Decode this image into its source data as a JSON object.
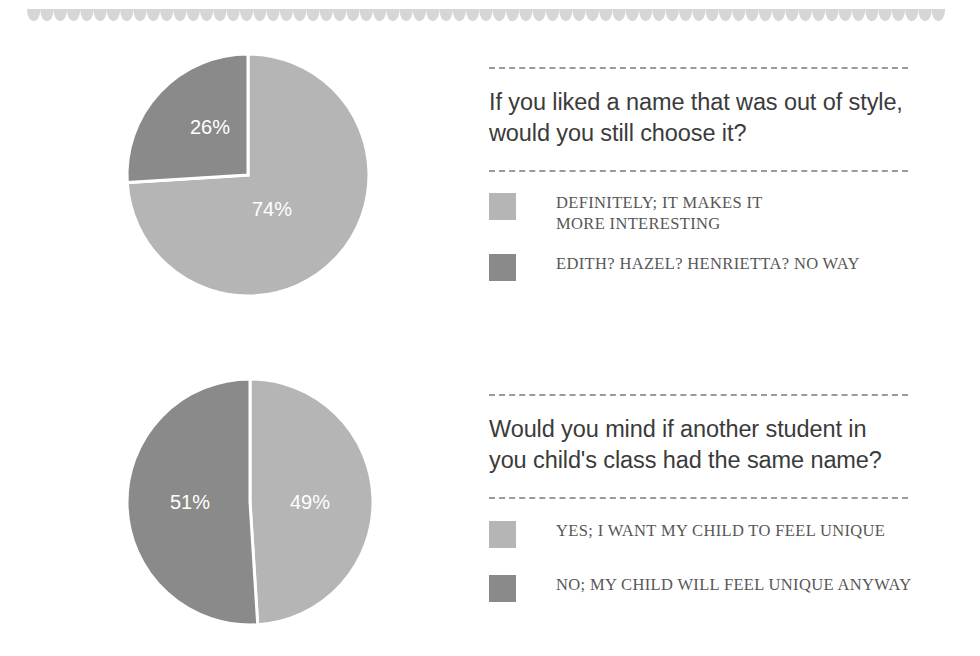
{
  "decor": {
    "scallop_color": "#d6d6d6",
    "scallop_count": 69
  },
  "palette": {
    "light_gray": "#b5b5b5",
    "dark_gray": "#8a8a8a",
    "question_text": "#3b3b3b",
    "legend_text": "#575757",
    "rule_color": "#9a9a9a",
    "slice_divider": "#ffffff"
  },
  "sections": [
    {
      "question": "If you liked a name that was out of style,\nwould you still choose it?",
      "legend": [
        {
          "label": "DEFINITELY; IT MAKES IT\nMORE INTERESTING",
          "color": "#b5b5b5"
        },
        {
          "label": "EDITH? HAZEL? HENRIETTA? NO WAY",
          "color": "#8a8a8a"
        }
      ]
    },
    {
      "question": "Would you mind if another student in\nyou child's class had the same name?",
      "legend": [
        {
          "label": "YES; I WANT MY CHILD TO FEEL UNIQUE",
          "color": "#b5b5b5"
        },
        {
          "label": "NO; MY CHILD WILL FEEL UNIQUE ANYWAY",
          "color": "#8a8a8a"
        }
      ]
    }
  ],
  "chart_data": [
    {
      "type": "pie",
      "title": "If you liked a name that was out of style, would you still choose it?",
      "labels": [
        "DEFINITELY; IT MAKES IT MORE INTERESTING",
        "EDITH? HAZEL? HENRIETTA? NO WAY"
      ],
      "values": [
        74,
        26
      ],
      "value_labels": [
        "74%",
        "26%"
      ],
      "colors": [
        "#b5b5b5",
        "#8a8a8a"
      ],
      "units": "percent",
      "start_angle_deg": 0,
      "direction": "clockwise",
      "legend_position": "right"
    },
    {
      "type": "pie",
      "title": "Would you mind if another student in you child's class had the same name?",
      "labels": [
        "YES; I WANT MY CHILD TO FEEL UNIQUE",
        "NO; MY CHILD WILL FEEL UNIQUE ANYWAY"
      ],
      "values": [
        49,
        51
      ],
      "value_labels": [
        "49%",
        "51%"
      ],
      "colors": [
        "#b5b5b5",
        "#8a8a8a"
      ],
      "units": "percent",
      "start_angle_deg": 0,
      "direction": "clockwise",
      "legend_position": "right"
    }
  ]
}
